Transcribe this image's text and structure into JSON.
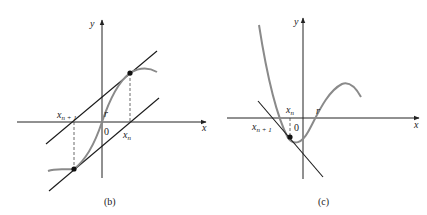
{
  "panels": [
    {
      "id": "b",
      "caption": "(b)",
      "axes": {
        "x_label": "x",
        "y_label": "y",
        "origin_label": "0"
      },
      "labels": {
        "x_n_base": "x",
        "x_n_sub": "n",
        "x_n1_base": "x",
        "x_n1_sub": "n + 1",
        "root": "r"
      },
      "description": "Newton's method oscillating: tangents at x_n and x_{n+1} are parallel, iterates bounce between two points around root r"
    },
    {
      "id": "c",
      "caption": "(c)",
      "axes": {
        "x_label": "x",
        "y_label": "y",
        "origin_label": "0"
      },
      "labels": {
        "x_n_base": "x",
        "x_n_sub": "n",
        "x_n1_base": "x",
        "x_n1_sub": "n + 1",
        "root": "r"
      },
      "description": "Newton's method moving away from root r: tangent at x_n leads to x_{n+1} farther left"
    }
  ],
  "colors": {
    "curve": "#8a8a8a",
    "lines": "#1a1a1a",
    "background": "#ffffff"
  }
}
